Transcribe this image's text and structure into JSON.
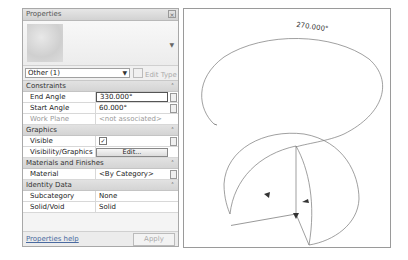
{
  "properties_panel": {
    "title": "Properties",
    "close_icon": "close-icon",
    "type_selector": {
      "value": "Other (1)"
    },
    "edit_type_label": "Edit Type",
    "sections": [
      {
        "label": "Constraints",
        "rows": [
          {
            "key": "End Angle",
            "value": "330.000°",
            "editing": true
          },
          {
            "key": "Start Angle",
            "value": "60.000°"
          },
          {
            "key": "Work Plane",
            "value": "<not associated>",
            "disabled": true
          }
        ]
      },
      {
        "label": "Graphics",
        "rows": [
          {
            "key": "Visible",
            "value": "✓",
            "type": "checkbox"
          },
          {
            "key": "Visibility/Graphics O...",
            "value": "Edit...",
            "type": "button"
          }
        ]
      },
      {
        "label": "Materials and Finishes",
        "rows": [
          {
            "key": "Material",
            "value": "<By Category>"
          }
        ]
      },
      {
        "label": "Identity Data",
        "rows": [
          {
            "key": "Subcategory",
            "value": "None"
          },
          {
            "key": "Solid/Void",
            "value": "Solid"
          }
        ]
      }
    ],
    "collapse_glyph": "˄",
    "footer": {
      "help_link": "Properties help",
      "apply_button": "Apply"
    }
  },
  "viewport": {
    "dimension_label": "270.000°",
    "shape": "partial sphere (revolve) with arc angle dimension"
  }
}
